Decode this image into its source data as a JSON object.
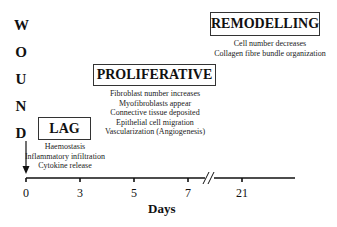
{
  "vertical_title": [
    "W",
    "O",
    "U",
    "N",
    "D"
  ],
  "phases": [
    {
      "name": "LAG",
      "items": [
        "Haemostasis",
        "Inflammatory infiltration",
        "Cytokine release"
      ]
    },
    {
      "name": "PROLIFERATIVE",
      "items": [
        "Fibroblast number increases",
        "Myofibroblasts appear",
        "Connective tissue deposited",
        "Epithelial cell migration",
        "Vascularization (Angiogenesis)"
      ]
    },
    {
      "name": "REMODELLING",
      "items": [
        "Cell  number decreases",
        "Collagen fibre bundle organization"
      ]
    }
  ],
  "axis": {
    "title": "Days",
    "ticks": [
      "0",
      "3",
      "5",
      "7",
      "21"
    ],
    "break_between": [
      "7",
      "21"
    ]
  },
  "colors": {
    "line": "#111111",
    "box_border": "#333333",
    "background": "#ffffff"
  }
}
